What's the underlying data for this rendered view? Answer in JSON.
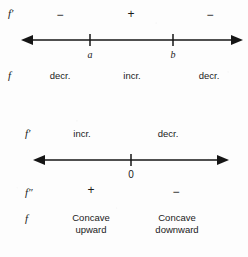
{
  "diagram": {
    "line_color": "#151515",
    "background": "#fdfdfd",
    "text_color": "#1a1a1a"
  },
  "first_chart": {
    "row_label": "f′",
    "signs": [
      "−",
      "+",
      "−"
    ],
    "tick_labels": [
      "a",
      "b"
    ],
    "function_row_label": "f",
    "behaviors": [
      "decr.",
      "incr.",
      "decr."
    ]
  },
  "second_chart": {
    "row_label": "f′",
    "behaviors_top": [
      "incr.",
      "decr."
    ],
    "tick_labels": [
      "0"
    ],
    "second_derivative_label": "f″",
    "signs": [
      "+",
      "−"
    ],
    "function_row_label": "f",
    "concavity": [
      "Concave upward",
      "Concave downward"
    ],
    "concavity_lines": [
      [
        "Concave",
        "upward"
      ],
      [
        "Concave",
        "downward"
      ]
    ]
  }
}
